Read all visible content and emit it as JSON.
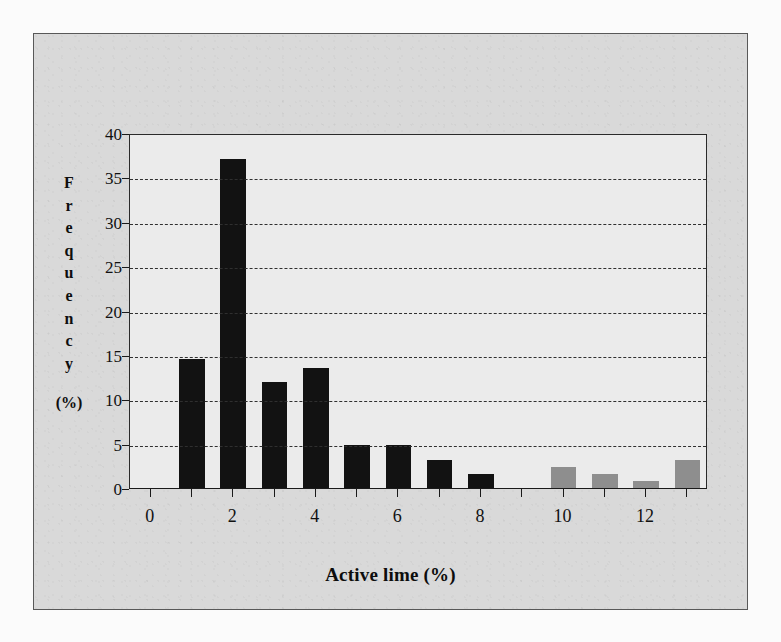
{
  "page": {
    "bleed_text_top": "the surrounding text of the scanned page shows through faintly from the reverse side of the paper and cannot be read clearly at this resolution because it is mirrored and very low in contrast across the upper portion of the sheet",
    "bleed_text_bottom": "faint mirrored show-through text along the lower margin of the scanned page"
  },
  "chart_data": {
    "type": "bar",
    "title": "",
    "xlabel": "Active lime (%)",
    "ylabel": "Frequency (%)",
    "ylabel_letters": [
      "F",
      "r",
      "e",
      "q",
      "u",
      "e",
      "n",
      "c",
      "y"
    ],
    "ylabel_unit": "(%)",
    "categories": [
      0,
      1,
      2,
      3,
      4,
      5,
      6,
      7,
      8,
      9,
      10,
      11,
      12,
      13
    ],
    "values": [
      0,
      14.6,
      37.2,
      12.1,
      13.6,
      5.0,
      5.0,
      3.3,
      1.7,
      0,
      2.5,
      1.7,
      0.9,
      3.3
    ],
    "bar_colors": [
      "#121212",
      "#121212",
      "#121212",
      "#121212",
      "#121212",
      "#121212",
      "#121212",
      "#121212",
      "#121212",
      "#121212",
      "#8e8e8e",
      "#8e8e8e",
      "#8e8e8e",
      "#8e8e8e"
    ],
    "ylim": [
      0,
      40
    ],
    "yticks": [
      0,
      5,
      10,
      15,
      20,
      25,
      30,
      35,
      40
    ],
    "xlim": [
      -0.5,
      13.5
    ],
    "xticks": [
      0,
      1,
      2,
      3,
      4,
      5,
      6,
      7,
      8,
      9,
      10,
      11,
      12,
      13
    ],
    "xtick_labels_shown": [
      0,
      2,
      4,
      6,
      8,
      10,
      12
    ],
    "grid": "horizontal-dashed",
    "legend": "none",
    "colors": {
      "plot_background": "#ebebeb",
      "chart_background": "#d9d9d9",
      "axis": "#1a1a1a",
      "grid": "#2f2f2f",
      "bar_primary": "#121212",
      "bar_secondary": "#8e8e8e"
    }
  }
}
